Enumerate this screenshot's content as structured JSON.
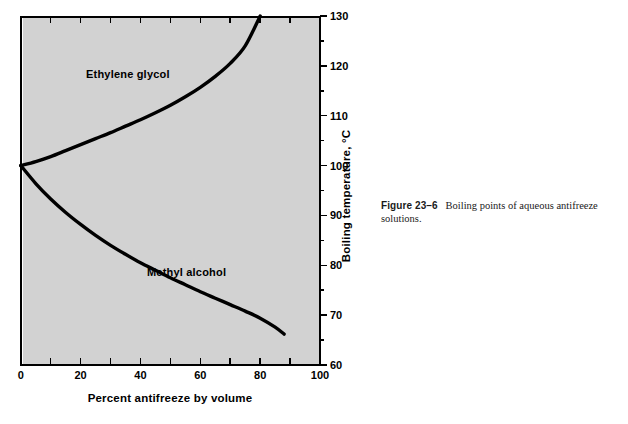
{
  "figure": {
    "caption_number": "Figure 23–6",
    "caption_text": "Boiling points of aqueous antifreeze solutions."
  },
  "chart_data": {
    "type": "line",
    "title": "",
    "xlabel": "Percent antifreeze by volume",
    "ylabel": "Boiling temperature, °C",
    "xlim": [
      0,
      100
    ],
    "ylim": [
      60,
      130
    ],
    "grid": false,
    "legend": "inline-series-labels",
    "x_ticks": [
      0,
      20,
      40,
      60,
      80,
      100
    ],
    "x_tick_labels": [
      "0",
      "20",
      "40",
      "60",
      "80",
      "100"
    ],
    "x_minor_ticks": [
      10,
      30,
      50,
      70,
      90
    ],
    "y_ticks": [
      60,
      70,
      80,
      90,
      100,
      110,
      120,
      130
    ],
    "y_tick_labels": [
      "60",
      "70",
      "80",
      "90",
      "100",
      "110",
      "120",
      "130"
    ],
    "series": [
      {
        "name": "Ethylene glycol",
        "label_x": 22,
        "label_y": 117,
        "x": [
          0,
          5,
          10,
          15,
          20,
          25,
          30,
          35,
          40,
          45,
          50,
          55,
          60,
          65,
          70,
          75,
          80
        ],
        "y": [
          100,
          100.8,
          101.8,
          103.0,
          104.2,
          105.4,
          106.6,
          107.9,
          109.2,
          110.6,
          112.1,
          113.8,
          115.7,
          117.9,
          120.5,
          124.0,
          130.0
        ]
      },
      {
        "name": "Methyl alcohol",
        "label_x": 43,
        "label_y": 79,
        "x": [
          0,
          5,
          10,
          15,
          20,
          25,
          30,
          35,
          40,
          45,
          50,
          55,
          60,
          65,
          70,
          75,
          80,
          85,
          88
        ],
        "y": [
          100,
          96.4,
          93.3,
          90.6,
          88.2,
          86.0,
          84.0,
          82.2,
          80.5,
          79.0,
          77.5,
          76.1,
          74.7,
          73.4,
          72.1,
          70.8,
          69.4,
          67.6,
          66.2
        ]
      }
    ]
  }
}
